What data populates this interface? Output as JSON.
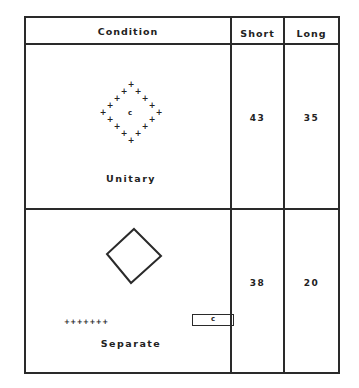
{
  "table": {
    "headers": {
      "condition": "Condition",
      "short": "Short",
      "long": "Long"
    },
    "rows": [
      {
        "condition": "Unitary",
        "short": "43",
        "long": "35",
        "figure": {
          "type": "diamond-of-plus-signs",
          "center_letter": "c"
        }
      },
      {
        "condition": "Separate",
        "short": "38",
        "long": "20",
        "figure": {
          "type": "outline-diamond-plus-row-and-boxed-letter",
          "plus_row": "+++++++",
          "boxed_letter": "c"
        }
      }
    ]
  }
}
